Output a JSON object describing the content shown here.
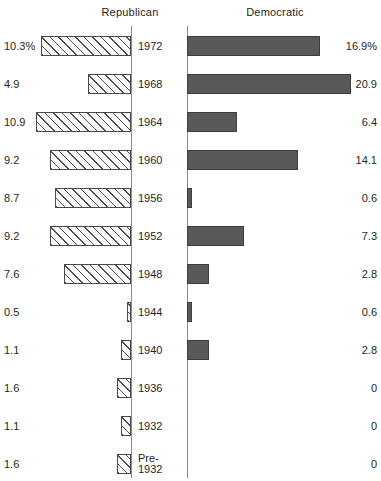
{
  "headings": {
    "republican": "Republican",
    "democratic": "Democratic"
  },
  "axis": {
    "republican_x": 131,
    "democratic_x": 187
  },
  "chart_data": {
    "type": "bar",
    "title": "",
    "subtitle": "",
    "orientation": "horizontal",
    "layout": "diverging-paired-bars",
    "xlabel": "",
    "ylabel": "",
    "grid": false,
    "legend_position": "top",
    "categories": [
      "1972",
      "1968",
      "1964",
      "1960",
      "1956",
      "1952",
      "1948",
      "1944",
      "1940",
      "1936",
      "1932",
      "Pre-\n1932"
    ],
    "series": [
      {
        "name": "Republican",
        "direction": "left",
        "unit": "%",
        "values": [
          10.3,
          4.9,
          10.9,
          9.2,
          8.7,
          9.2,
          7.6,
          0.5,
          1.1,
          1.6,
          1.1,
          1.6
        ],
        "labels": [
          "10.3%",
          "4.9",
          "10.9",
          "9.2",
          "8.7",
          "9.2",
          "7.6",
          "0.5",
          "1.1",
          "1.6",
          "1.1",
          "1.6"
        ]
      },
      {
        "name": "Democratic",
        "direction": "right",
        "unit": "%",
        "values": [
          16.9,
          20.9,
          6.4,
          14.1,
          0.6,
          7.3,
          2.8,
          0.6,
          2.8,
          0,
          0,
          0
        ],
        "labels": [
          "16.9%",
          "20.9",
          "6.4",
          "14.1",
          "0.6",
          "7.3",
          "2.8",
          "0.6",
          "2.8",
          "0",
          "0",
          "0"
        ]
      }
    ],
    "xlim_left": [
      0,
      11
    ],
    "xlim_right": [
      0,
      22
    ],
    "px_per_unit_left": 8.75,
    "px_per_unit_right": 7.85
  },
  "rows": [
    {
      "year": "1972",
      "rep_label": "10.3%",
      "rep_value": 10.3,
      "dem_label": "16.9%",
      "dem_value": 16.9
    },
    {
      "year": "1968",
      "rep_label": "4.9",
      "rep_value": 4.9,
      "dem_label": "20.9",
      "dem_value": 20.9
    },
    {
      "year": "1964",
      "rep_label": "10.9",
      "rep_value": 10.9,
      "dem_label": "6.4",
      "dem_value": 6.4
    },
    {
      "year": "1960",
      "rep_label": "9.2",
      "rep_value": 9.2,
      "dem_label": "14.1",
      "dem_value": 14.1
    },
    {
      "year": "1956",
      "rep_label": "8.7",
      "rep_value": 8.7,
      "dem_label": "0.6",
      "dem_value": 0.6
    },
    {
      "year": "1952",
      "rep_label": "9.2",
      "rep_value": 9.2,
      "dem_label": "7.3",
      "dem_value": 7.3
    },
    {
      "year": "1948",
      "rep_label": "7.6",
      "rep_value": 7.6,
      "dem_label": "2.8",
      "dem_value": 2.8
    },
    {
      "year": "1944",
      "rep_label": "0.5",
      "rep_value": 0.5,
      "dem_label": "0.6",
      "dem_value": 0.6
    },
    {
      "year": "1940",
      "rep_label": "1.1",
      "rep_value": 1.1,
      "dem_label": "2.8",
      "dem_value": 2.8
    },
    {
      "year": "1936",
      "rep_label": "1.6",
      "rep_value": 1.6,
      "dem_label": "0",
      "dem_value": 0
    },
    {
      "year": "1932",
      "rep_label": "1.1",
      "rep_value": 1.1,
      "dem_label": "0",
      "dem_value": 0
    },
    {
      "year": "Pre-\n1932",
      "rep_label": "1.6",
      "rep_value": 1.6,
      "dem_label": "0",
      "dem_value": 0
    }
  ],
  "colors": {
    "democratic_bar": "#595959",
    "republican_bar_outline": "#4a4a4a",
    "axis_line": "#8c8c8c",
    "text": "#1f1f1f",
    "background": "#ffffff"
  }
}
